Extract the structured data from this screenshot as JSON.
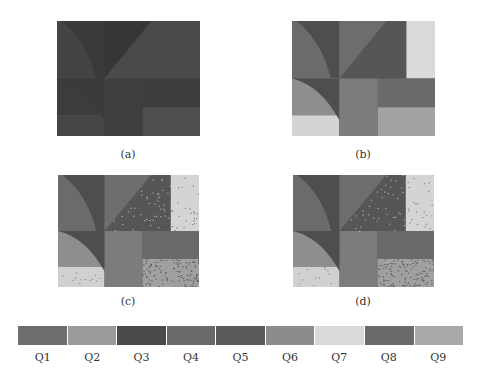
{
  "figure": {
    "panels": [
      {
        "id": "a",
        "caption": "(a)",
        "noise": false,
        "colors": {
          "arc": "#444444",
          "sliver": "#3a3a3a",
          "tri_upper": "#363636",
          "tri_lower": "#4a4a4a",
          "top_right": "#4a4a4a",
          "mid_left": "#3c3c3c",
          "bot_left": "#464646",
          "mid_col": "#3e3e3e",
          "right_mid": "#3c3c3c",
          "bot_right": "#4e4e4e"
        }
      },
      {
        "id": "b",
        "caption": "(b)",
        "noise": false,
        "colors": {
          "arc": "#6b6b6b",
          "sliver": "#4e4e4e",
          "tri_upper": "#6e6e6e",
          "tri_lower": "#565656",
          "top_right": "#d9d9d9",
          "mid_left": "#8e8e8e",
          "bot_left": "#d4d4d4",
          "mid_col": "#7c7c7c",
          "right_mid": "#6a6a6a",
          "bot_right": "#a2a2a2"
        }
      },
      {
        "id": "c",
        "caption": "(c)",
        "noise": true,
        "colors": {
          "arc": "#6b6b6b",
          "sliver": "#4e4e4e",
          "tri_upper": "#6e6e6e",
          "tri_lower": "#565656",
          "top_right": "#d4d4d4",
          "mid_left": "#8e8e8e",
          "bot_left": "#d0d0d0",
          "mid_col": "#7c7c7c",
          "right_mid": "#6a6a6a",
          "bot_right": "#a0a0a0"
        }
      },
      {
        "id": "d",
        "caption": "(d)",
        "noise": true,
        "colors": {
          "arc": "#6b6b6b",
          "sliver": "#4e4e4e",
          "tri_upper": "#6e6e6e",
          "tri_lower": "#565656",
          "top_right": "#d4d4d4",
          "mid_left": "#8e8e8e",
          "bot_left": "#d0d0d0",
          "mid_col": "#7c7c7c",
          "right_mid": "#6a6a6a",
          "bot_right": "#a0a0a0"
        }
      }
    ],
    "legend": [
      {
        "label": "Q1",
        "color": "#6e6e6e"
      },
      {
        "label": "Q2",
        "color": "#9b9b9b"
      },
      {
        "label": "Q3",
        "color": "#4a4a4a"
      },
      {
        "label": "Q4",
        "color": "#6a6a6a"
      },
      {
        "label": "Q5",
        "color": "#5a5a5a"
      },
      {
        "label": "Q6",
        "color": "#8c8c8c"
      },
      {
        "label": "Q7",
        "color": "#dadada"
      },
      {
        "label": "Q8",
        "color": "#6a6a6a"
      },
      {
        "label": "Q9",
        "color": "#a9a9a9"
      }
    ]
  }
}
